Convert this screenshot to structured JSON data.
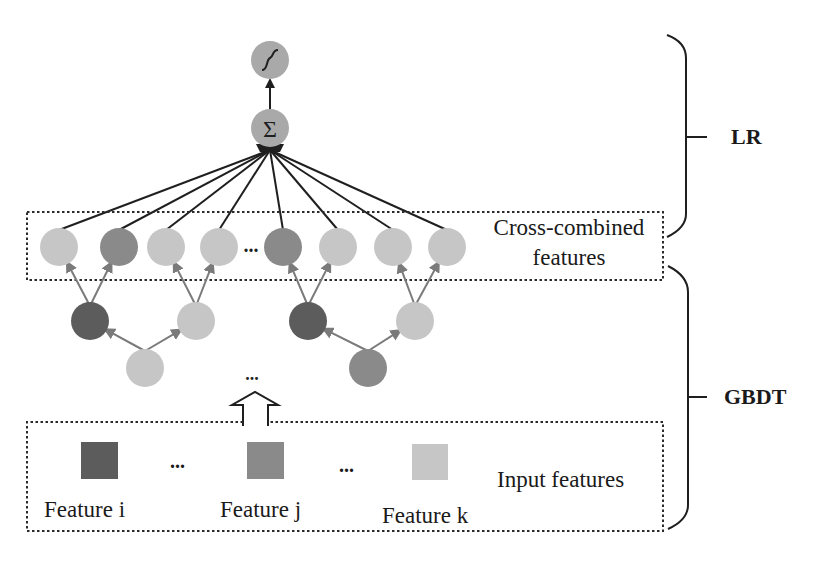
{
  "colors": {
    "dark": "#5c5c5c",
    "medium": "#8a8a8a",
    "light": "#c6c6c6",
    "lighter": "#d0d0d0",
    "output_node": "#a9a9a9",
    "line": "#1f1f1f",
    "tree_arrow": "#7a7a7a",
    "dotted_border": "#2a2a2a"
  },
  "output_layer": {
    "sigmoid_symbol": "∫",
    "sum_symbol": "Σ"
  },
  "cross_combined": {
    "label_line1": "Cross-combined",
    "label_line2": "features",
    "ellipsis": "...",
    "nodes": [
      {
        "x": 59,
        "shade": "light"
      },
      {
        "x": 119,
        "shade": "medium"
      },
      {
        "x": 166,
        "shade": "light"
      },
      {
        "x": 219,
        "shade": "light"
      },
      {
        "x": 283,
        "shade": "medium"
      },
      {
        "x": 338,
        "shade": "light"
      },
      {
        "x": 393,
        "shade": "light"
      },
      {
        "x": 447,
        "shade": "light"
      }
    ]
  },
  "trees": {
    "ellipsis": "...",
    "items": [
      {
        "root": {
          "x": 145,
          "shade": "light"
        },
        "left": {
          "x": 90,
          "shade": "dark"
        },
        "right": {
          "x": 196,
          "shade": "light"
        }
      },
      {
        "root": {
          "x": 368,
          "shade": "medium"
        },
        "left": {
          "x": 308,
          "shade": "dark"
        },
        "right": {
          "x": 415,
          "shade": "light"
        }
      }
    ]
  },
  "input_features": {
    "label": "Input features",
    "ellipsis": "...",
    "features": [
      {
        "name": "Feature i",
        "shade": "dark"
      },
      {
        "name": "Feature j",
        "shade": "medium"
      },
      {
        "name": "Feature k",
        "shade": "light"
      }
    ]
  },
  "braces": {
    "lr_label": "LR",
    "gbdt_label": "GBDT"
  }
}
